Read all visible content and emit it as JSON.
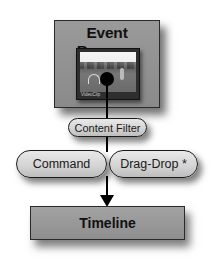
{
  "diagram": {
    "nodes": {
      "event_browser": {
        "label": "Event Browser",
        "thumbnail_label": "VideoClip"
      },
      "content_filter": {
        "label": "Content Filter"
      },
      "command": {
        "label": "Command"
      },
      "drag_drop": {
        "label": "Drag-Drop *"
      },
      "timeline": {
        "label": "Timeline"
      }
    },
    "edges": [
      {
        "from": "event_browser",
        "to": "timeline",
        "via": [
          "content_filter",
          "command",
          "drag_drop"
        ],
        "arrow": "end"
      }
    ]
  }
}
